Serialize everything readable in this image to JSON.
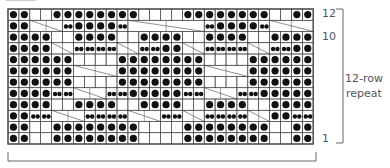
{
  "chart_data": {
    "type": "table",
    "columns": 28,
    "rows_count": 12,
    "legend": {
      "k": "purl (dot)",
      "w": "knit (blank)",
      "s": "cable stitch (small dots)",
      "c": "cable crossing"
    },
    "grid_top_to_bottom": [
      "kkwwkkkkkkkkwwwwkkkkkkkkwwkk",
      "kkcccskkkkscccccccskkkkscccc",
      "kkkkwwkkkkwwkkkkwwkkkkwwkkkk",
      "kkkkccssssccsskkccssssccsskk",
      "kkkkkkwwwwkkkkkkkkwwwwkkkkkk",
      "kkkkkkcccckkkkkkkkcccckkkkkk",
      "kkkkkkwwwwkkkkkkkkwwwwkkkkkk",
      "kkkksscccsskkkkksscccsskkkkk",
      "kkkkwwkkkkwwkkkkwwkkkkwwkkkk",
      "kksscccsssscccssccsssscckkss",
      "kkwwkkkkkkkkwwwwkkkkkkkkwwkk",
      "kkwwkkkkkkkkwwwwkkkkkkkkwwkk"
    ],
    "row_labels": [
      {
        "row": 12,
        "text": "12"
      },
      {
        "row": 10,
        "text": "10"
      },
      {
        "row": 1,
        "text": "1"
      }
    ],
    "annotation": "12-row repeat"
  },
  "labels": {
    "row12": "12",
    "row10": "10",
    "row1": "1",
    "repeat_line1": "12-row",
    "repeat_line2": "repeat"
  },
  "colors": {
    "grid": "#444444",
    "dot": "#111111",
    "bracket": "#666666"
  }
}
